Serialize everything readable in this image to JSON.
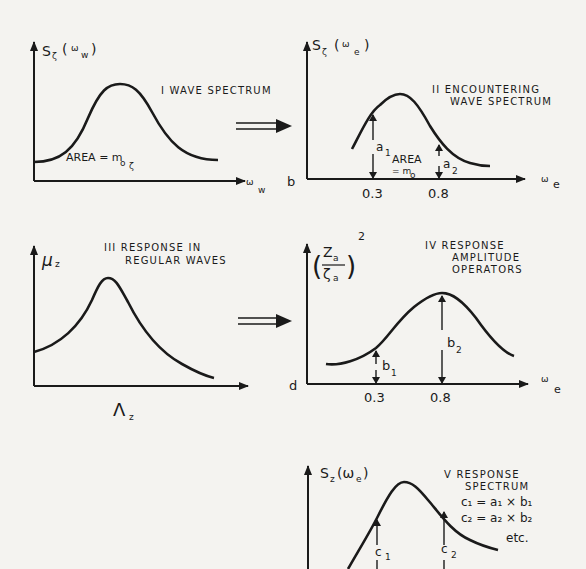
{
  "panels": {
    "p1": {
      "roman": "I",
      "title": "WAVE SPECTRUM",
      "y_label_main": "S",
      "y_label_sub": "ζ",
      "y_label_arg": "(",
      "y_label_omega": "ω",
      "y_label_omega_sub": "w",
      "y_label_close": ")",
      "x_label": "ω",
      "x_label_sub": "w",
      "area_label": "AREA = m",
      "area_sub_o": "o",
      "area_sub_zeta": "ζ"
    },
    "p2": {
      "roman": "II",
      "title_line1": "ENCOUNTERING",
      "title_line2": "WAVE SPECTRUM",
      "y_label_main": "S",
      "y_label_sub": "ζ",
      "y_label_arg": "(",
      "y_label_omega": "ω",
      "y_label_omega_sub": "e",
      "y_label_close": ")",
      "x_label": "ω",
      "x_label_sub": "e",
      "corner_letter": "b",
      "area_line1": "AREA",
      "area_line2": "= m",
      "area_line2_sub": "o",
      "a1": "a",
      "a1_sub": "1",
      "a2": "a",
      "a2_sub": "2",
      "ticks": [
        "0.3",
        "0.8"
      ]
    },
    "p3": {
      "roman": "III",
      "title_line1": "RESPONSE IN",
      "title_line2": "REGULAR WAVES",
      "y_label": "μ",
      "y_label_sub": "z",
      "x_label": "Λ",
      "x_label_sub": "z"
    },
    "p4": {
      "roman": "IV",
      "title_line1": "RESPONSE",
      "title_line2": "AMPLITUDE",
      "title_line3": "OPERATORS",
      "y_label_num": "Z",
      "y_label_num_sub": "a",
      "y_label_den": "ζ",
      "y_label_den_sub": "a",
      "y_label_exp": "2",
      "x_label": "ω",
      "x_label_sub": "e",
      "corner_letter": "d",
      "b1": "b",
      "b1_sub": "1",
      "b2": "b",
      "b2_sub": "2",
      "ticks": [
        "0.3",
        "0.8"
      ]
    },
    "p5": {
      "roman": "V",
      "title_line1": "RESPONSE",
      "title_line2": "SPECTRUM",
      "eq1": "c₁ = a₁ × b₁",
      "eq2": "c₂ = a₂ × b₂",
      "etc": "etc.",
      "y_label": "S",
      "y_label_sub": "z",
      "y_label_arg": "(ω",
      "y_label_arg_sub": "e",
      "y_label_close": ")",
      "c1": "c",
      "c1_sub": "1",
      "c2": "c",
      "c2_sub": "2"
    }
  },
  "arrows": [
    {
      "from": "I",
      "to": "II",
      "style": "double-shaft"
    },
    {
      "from": "III",
      "to": "IV",
      "style": "double-shaft"
    }
  ]
}
